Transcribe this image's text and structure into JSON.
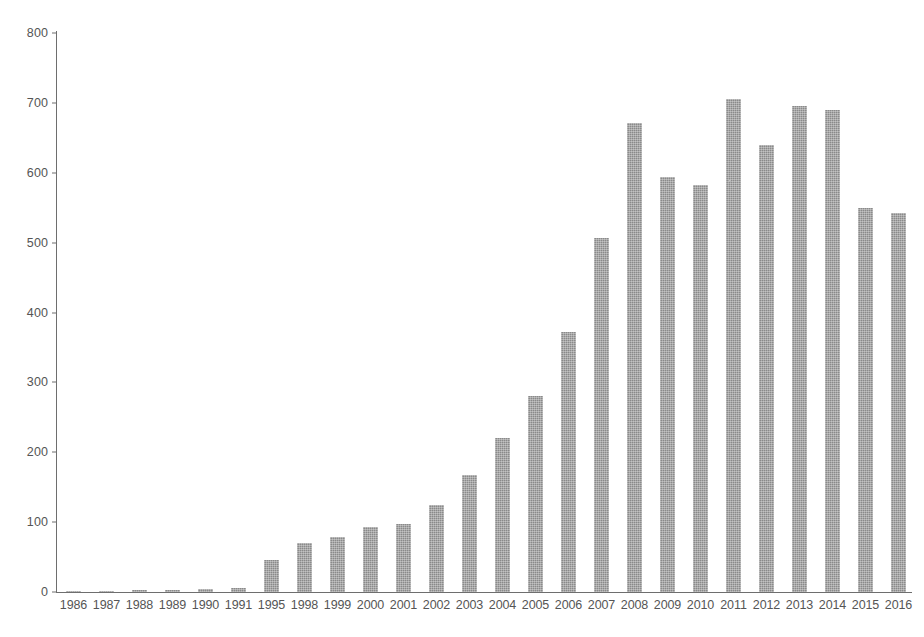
{
  "chart_data": {
    "type": "bar",
    "title": "",
    "subtitle": "",
    "xlabel": "",
    "ylabel": "",
    "ylim": [
      0,
      800
    ],
    "ytick_values": [
      0,
      100,
      200,
      300,
      400,
      500,
      600,
      700,
      800
    ],
    "ytick_labels": [
      "0",
      "100",
      "200",
      "300",
      "400",
      "500",
      "600",
      "700",
      "800"
    ],
    "grid": false,
    "legend": null,
    "legend_position": "none",
    "bar_color": "#8a8a8a",
    "axis_color": "#6e6e6e",
    "text_color": "#555555",
    "background_color": "#ffffff",
    "categories": [
      "1986",
      "1987",
      "1988",
      "1989",
      "1990",
      "1991",
      "1995",
      "1998",
      "1999",
      "2000",
      "2001",
      "2002",
      "2003",
      "2004",
      "2005",
      "2006",
      "2007",
      "2008",
      "2009",
      "2010",
      "2011",
      "2012",
      "2013",
      "2014",
      "2015",
      "2016"
    ],
    "values": [
      1,
      2,
      3,
      3,
      4,
      6,
      46,
      70,
      79,
      93,
      98,
      125,
      168,
      220,
      280,
      372,
      507,
      671,
      594,
      582,
      706,
      640,
      696,
      690,
      550,
      542
    ]
  }
}
